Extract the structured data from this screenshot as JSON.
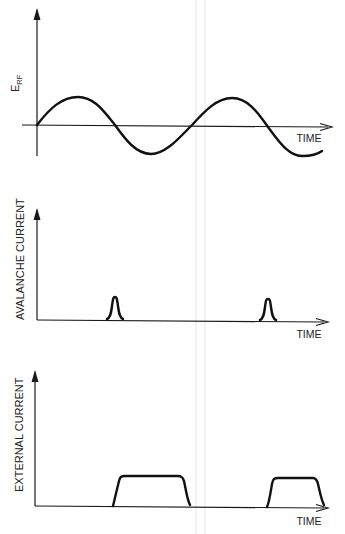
{
  "figure": {
    "panels": [
      {
        "id": "erf",
        "y_label_main": "E",
        "y_label_sub": "RF",
        "x_label": "TIME",
        "signal": "sinusoid",
        "description": "RF electric field sinusoid, two full cycles"
      },
      {
        "id": "avalanche",
        "y_label": "AVALANCHE CURRENT",
        "x_label": "TIME",
        "signal": "narrow pulses",
        "description": "Narrow avalanche current pulses at the negative-going zero crossings of the RF field"
      },
      {
        "id": "external",
        "y_label": "EXTERNAL CURRENT",
        "x_label": "TIME",
        "signal": "trapezoidal pulses",
        "description": "Flat-topped external current pulses starting at each avalanche pulse"
      }
    ]
  },
  "colors": {
    "ink": "#111111",
    "background": "#ffffff"
  }
}
